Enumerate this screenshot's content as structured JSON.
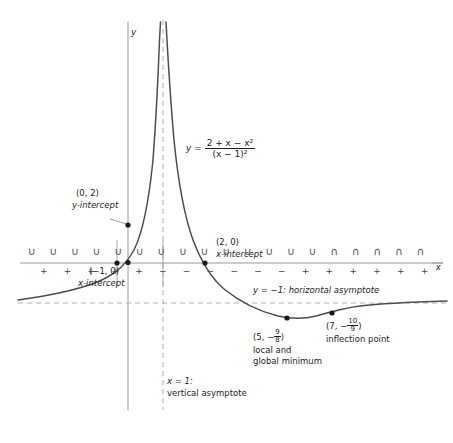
{
  "figure": {
    "kind": "calculus-curve-sketch",
    "function_label": {
      "y": "y",
      "equals": "=",
      "numerator": "2 + x − x²",
      "denominator": "(x − 1)²",
      "full": "y = (2 + x − x^2)/(x − 1)^2"
    },
    "axes": {
      "x_axis_label": "x",
      "y_axis_label": "y"
    },
    "annotations": {
      "y_intercept": {
        "point": "(0, 2)",
        "caption": "y-intercept"
      },
      "x_intercept_left": {
        "point": "(−1, 0)",
        "caption": "x-intercept"
      },
      "x_intercept_right": {
        "point": "(2, 0)",
        "caption": "x-intercept"
      },
      "minimum": {
        "point_x": "(5, −",
        "point_frac_num": "9",
        "point_frac_den": "8",
        "point_close": ")",
        "caption_line1": "local and",
        "caption_line2": "global minimum"
      },
      "inflection": {
        "point_x": "(7, −",
        "point_frac_num": "10",
        "point_frac_den": "9",
        "point_close": ")",
        "caption": "inflection point"
      },
      "vertical_asymptote": {
        "line1": "x = 1:",
        "line2": "vertical asymptote"
      },
      "horizontal_asymptote": {
        "text": "y = −1: horizontal asymptote"
      }
    },
    "sign_chart": {
      "plus": "+",
      "minus": "−",
      "concave_up": "∪",
      "concave_down": "∩",
      "signs": [
        "+",
        "+",
        "+",
        "+",
        "+",
        "−",
        "−",
        "−",
        "−",
        "−",
        "−",
        "+",
        "+",
        "+",
        "+",
        "+",
        "+"
      ],
      "concavity": [
        "up",
        "up",
        "up",
        "up",
        "up",
        "up",
        "up",
        "up",
        "up",
        "up",
        "up",
        "up",
        "up",
        "up",
        "down",
        "down",
        "down",
        "down",
        "down"
      ]
    },
    "colors": {
      "curve": "#4d4d4d",
      "axis": "#8e8e8e",
      "asymptote": "#a8a8a8",
      "text": "#231f20",
      "point": "#1a1a1a"
    }
  },
  "chart_data": {
    "type": "line",
    "title": "",
    "xlabel": "x",
    "ylabel": "y",
    "function": "y = (2 + x - x^2)/(x - 1)^2",
    "xlim": [
      -9,
      16
    ],
    "ylim": [
      -2,
      9
    ],
    "grid": false,
    "legend": "none",
    "asymptotes": [
      {
        "kind": "vertical",
        "value": 1,
        "label": "x = 1: vertical asymptote",
        "style": "dashed"
      },
      {
        "kind": "horizontal",
        "value": -1,
        "label": "y = -1: horizontal asymptote",
        "style": "dashed"
      }
    ],
    "points": [
      {
        "label": "(0, 2)",
        "x": 0,
        "y": 2,
        "role": "y-intercept"
      },
      {
        "label": "(-1, 0)",
        "x": -1,
        "y": 0,
        "role": "x-intercept"
      },
      {
        "label": "(2, 0)",
        "x": 2,
        "y": 0,
        "role": "x-intercept"
      },
      {
        "label": "(5, -9/8)",
        "x": 5,
        "y": -1.125,
        "role": "local and global minimum"
      },
      {
        "label": "(7, -10/9)",
        "x": 7,
        "y": -1.1111,
        "role": "inflection point"
      }
    ],
    "series": [
      {
        "name": "left branch",
        "x": [
          -9,
          -8,
          -7,
          -6,
          -5,
          -4,
          -3,
          -2,
          -1,
          0,
          0.4,
          0.7,
          0.85,
          0.93
        ],
        "y": [
          -0.88,
          -0.864,
          -0.844,
          -0.816,
          -0.778,
          -0.72,
          -0.625,
          -0.444,
          0,
          2,
          8.78,
          38.3,
          171.7,
          760
        ]
      },
      {
        "name": "right branch",
        "x": [
          1.07,
          1.15,
          1.3,
          1.6,
          2,
          2.5,
          3,
          3.5,
          4,
          5,
          6,
          7,
          8,
          9,
          10,
          12,
          14,
          16
        ],
        "y": [
          845,
          189,
          42.0,
          6.33,
          0,
          -0.556,
          -1,
          -1.12,
          -1.11,
          -1.125,
          -1.12,
          -1.111,
          -1.102,
          -1.094,
          -1.086,
          -1.074,
          -1.065,
          -1.058
        ]
      }
    ]
  }
}
